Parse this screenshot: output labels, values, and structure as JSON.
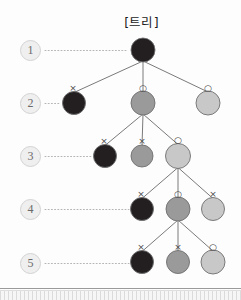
{
  "figure": {
    "title": "[트리]",
    "background_color": "#fdfdfd"
  },
  "colors": {
    "node_dark": "#231f20",
    "node_mid": "#9a9a9a",
    "node_light": "#c8c8c8",
    "node_stroke": "#6f6f6f",
    "edge": "#7a7a7a",
    "dotted_guide": "#b5b5b5",
    "badge_fill": "#efefef",
    "badge_text": "#6a6a6a",
    "marker_text": "#4a4a4a"
  },
  "levels": [
    {
      "label": "1",
      "badge_x": 20,
      "badge_y": 40,
      "guide_to_x": 128
    },
    {
      "label": "2",
      "badge_x": 20,
      "badge_y": 93,
      "guide_to_x": 60
    },
    {
      "label": "3",
      "badge_x": 20,
      "badge_y": 146,
      "guide_to_x": 92
    },
    {
      "label": "4",
      "badge_x": 20,
      "badge_y": 199,
      "guide_to_x": 129
    },
    {
      "label": "5",
      "badge_x": 20,
      "badge_y": 253,
      "guide_to_x": 129
    }
  ],
  "nodes": [
    {
      "id": "n1",
      "level": 1,
      "cx": 143,
      "cy": 50,
      "r": 12,
      "fill": "node_dark",
      "marker": "",
      "marker_dx": 0,
      "marker_dy": 0
    },
    {
      "id": "n2a",
      "level": 2,
      "cx": 74,
      "cy": 103,
      "r": 11.5,
      "fill": "node_dark",
      "marker": "×",
      "marker_dx": -1,
      "marker_dy": -15
    },
    {
      "id": "n2b",
      "level": 2,
      "cx": 143,
      "cy": 103,
      "r": 12,
      "fill": "node_mid",
      "marker": "○",
      "marker_dx": 0,
      "marker_dy": -15
    },
    {
      "id": "n2c",
      "level": 2,
      "cx": 208,
      "cy": 103,
      "r": 12,
      "fill": "node_light",
      "marker": "○",
      "marker_dx": 0,
      "marker_dy": -15
    },
    {
      "id": "n3a",
      "level": 3,
      "cx": 105,
      "cy": 156,
      "r": 11.5,
      "fill": "node_dark",
      "marker": "×",
      "marker_dx": -1,
      "marker_dy": -15
    },
    {
      "id": "n3b",
      "level": 3,
      "cx": 142,
      "cy": 156,
      "r": 11,
      "fill": "node_mid",
      "marker": "×",
      "marker_dx": 0,
      "marker_dy": -15
    },
    {
      "id": "n3c",
      "level": 3,
      "cx": 178,
      "cy": 156,
      "r": 12.5,
      "fill": "node_light",
      "marker": "○",
      "marker_dx": 0,
      "marker_dy": -16
    },
    {
      "id": "n4a",
      "level": 4,
      "cx": 142,
      "cy": 209,
      "r": 11.5,
      "fill": "node_dark",
      "marker": "×",
      "marker_dx": -1,
      "marker_dy": -15
    },
    {
      "id": "n4b",
      "level": 4,
      "cx": 178,
      "cy": 209,
      "r": 12,
      "fill": "node_mid",
      "marker": "○",
      "marker_dx": 0,
      "marker_dy": -15
    },
    {
      "id": "n4c",
      "level": 4,
      "cx": 213,
      "cy": 209,
      "r": 11.5,
      "fill": "node_light",
      "marker": "×",
      "marker_dx": 0,
      "marker_dy": -15
    },
    {
      "id": "n5a",
      "level": 5,
      "cx": 142,
      "cy": 262,
      "r": 11.5,
      "fill": "node_dark",
      "marker": "×",
      "marker_dx": -1,
      "marker_dy": -15
    },
    {
      "id": "n5b",
      "level": 5,
      "cx": 178,
      "cy": 262,
      "r": 11.5,
      "fill": "node_mid",
      "marker": "×",
      "marker_dx": 0,
      "marker_dy": -15
    },
    {
      "id": "n5c",
      "level": 5,
      "cx": 213,
      "cy": 262,
      "r": 12,
      "fill": "node_light",
      "marker": "○",
      "marker_dx": 0,
      "marker_dy": -15
    }
  ],
  "edges": [
    {
      "from": "n1",
      "to": "n2a"
    },
    {
      "from": "n1",
      "to": "n2b"
    },
    {
      "from": "n1",
      "to": "n2c"
    },
    {
      "from": "n2b",
      "to": "n3a"
    },
    {
      "from": "n2b",
      "to": "n3b"
    },
    {
      "from": "n2b",
      "to": "n3c"
    },
    {
      "from": "n3c",
      "to": "n4a"
    },
    {
      "from": "n3c",
      "to": "n4b"
    },
    {
      "from": "n3c",
      "to": "n4c"
    },
    {
      "from": "n4b",
      "to": "n5a"
    },
    {
      "from": "n4b",
      "to": "n5b"
    },
    {
      "from": "n4b",
      "to": "n5c"
    }
  ]
}
